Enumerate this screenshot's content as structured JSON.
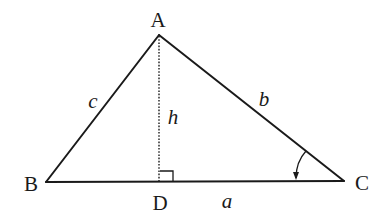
{
  "diagram": {
    "type": "triangle-with-altitude",
    "colors": {
      "stroke": "#1a1a1a",
      "background": "#ffffff"
    },
    "vertices": {
      "A": {
        "label": "A",
        "x": 159,
        "y": 35
      },
      "B": {
        "label": "B",
        "x": 46,
        "y": 182
      },
      "C": {
        "label": "C",
        "x": 344,
        "y": 181
      },
      "D": {
        "label": "D",
        "x": 159,
        "y": 182
      }
    },
    "sides": {
      "a": {
        "label": "a",
        "from": "B",
        "to": "C"
      },
      "b": {
        "label": "b",
        "from": "A",
        "to": "C"
      },
      "c": {
        "label": "c",
        "from": "A",
        "to": "B"
      }
    },
    "altitude": {
      "label": "h",
      "from": "A",
      "to": "D",
      "style": "dotted"
    },
    "right_angle_marker": {
      "at": "D"
    },
    "angle_marker": {
      "at": "C",
      "style": "arc-with-arrow"
    }
  }
}
